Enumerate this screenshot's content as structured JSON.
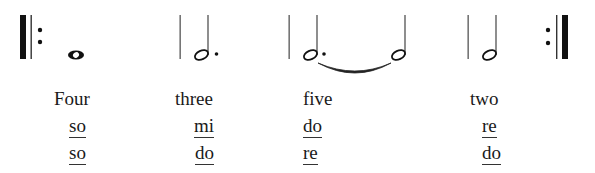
{
  "measures": [
    {
      "index": 1,
      "note": "whole note",
      "count_word": "Four",
      "solfege_row_1": "so",
      "solfege_row_2": "so"
    },
    {
      "index": 2,
      "note": "dotted half note",
      "count_word": "three",
      "solfege_row_1": "mi",
      "solfege_row_2": "do"
    },
    {
      "index": 3,
      "note": "dotted half note tied to half note",
      "count_word": "five",
      "solfege_row_1": "do",
      "solfege_row_2": "re"
    },
    {
      "index": 4,
      "note": "half note",
      "count_word": "two",
      "solfege_row_1": "re",
      "solfege_row_2": "do"
    }
  ],
  "notation": {
    "start_repeat": "start-repeat-sign",
    "end_repeat": "end-repeat-sign",
    "ink_color": "#1a1a1a"
  }
}
